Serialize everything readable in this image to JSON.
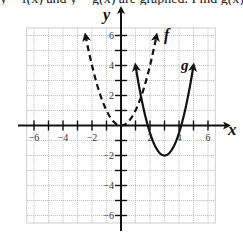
{
  "chart_data": {
    "type": "line",
    "title": "",
    "xlabel": "x",
    "ylabel": "y",
    "xlim": [
      -6.5,
      6.5
    ],
    "ylim": [
      -6.5,
      6.5
    ],
    "grid": true,
    "x_ticks": [
      -6,
      -5,
      -4,
      -3,
      -2,
      -1,
      1,
      2,
      3,
      4,
      5,
      6
    ],
    "x_tick_labels": [
      "-6",
      "-4",
      "-2",
      "2",
      "4",
      "6"
    ],
    "x_tick_label_values": [
      -6,
      -4,
      -2,
      2,
      4,
      6
    ],
    "y_ticks": [
      -6,
      -5,
      -4,
      -3,
      -2,
      -1,
      1,
      2,
      3,
      4,
      5,
      6
    ],
    "y_tick_labels": [
      "6",
      "4",
      "2",
      "-2",
      "-4",
      "-6"
    ],
    "y_tick_label_values": [
      6,
      4,
      2,
      -2,
      -4,
      -6
    ],
    "series": [
      {
        "name": "f",
        "style": "dashed",
        "equation": "f(x) = x^2",
        "domain": [
          -2.45,
          2.45
        ],
        "vertex": [
          0,
          0
        ],
        "endpoints_arrows": [
          [
            -2.45,
            6.0
          ],
          [
            2.45,
            6.0
          ]
        ]
      },
      {
        "name": "g",
        "style": "solid",
        "equation": "g(x) = 1.5(x - 3)^2 - 2",
        "domain": [
          1,
          5
        ],
        "vertex": [
          3,
          -2
        ],
        "endpoints_arrows": [
          [
            1,
            4
          ],
          [
            5,
            4
          ]
        ]
      }
    ],
    "annotations": [
      {
        "text": "f",
        "near": [
          3.2,
          6.0
        ]
      },
      {
        "text": "g",
        "near": [
          4.5,
          4.1
        ]
      }
    ]
  },
  "labels": {
    "x_axis": "x",
    "y_axis": "y",
    "f_label": "f",
    "g_label": "g",
    "top_cut_text": "y = f(x) and y = g(x) are graphed. Find g(x)"
  }
}
